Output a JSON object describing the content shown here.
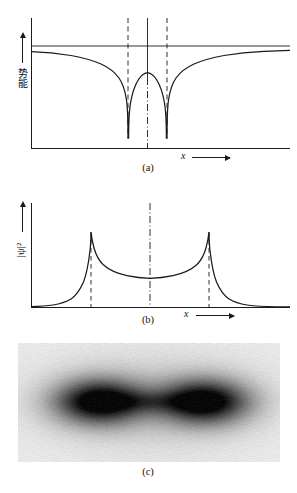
{
  "figure": {
    "background_color": "#ffffff",
    "line_color": "#1a1a1a",
    "width": 297,
    "height": 493
  },
  "panels": [
    {
      "id": "a",
      "caption": "(a)",
      "ylabel": "势能",
      "ylabel_meaning": "potential-energy",
      "xlabel": "x",
      "description": "Double-well potential energy curve with two deep wells and a central hump"
    },
    {
      "id": "b",
      "caption": "(b)",
      "ylabel": "|ψ|²",
      "ylabel_meaning": "probability-density",
      "xlabel": "x",
      "description": "Probability density showing two sharp cusps at the nuclei positions"
    },
    {
      "id": "c",
      "caption": "(c)",
      "description": "Grayscale electron density map showing two dark lobes joined by a faint bridge"
    }
  ],
  "chart_data": [
    {
      "type": "line",
      "panel": "a",
      "title": "",
      "xlabel": "x",
      "ylabel": "势能",
      "xlim": [
        0,
        1
      ],
      "ylim": [
        -1.15,
        0.22
      ],
      "grid": false,
      "legend": null,
      "annotations": {
        "zero_level_line": 0.0,
        "nucleus_positions": [
          0.385,
          0.57
        ],
        "center_axis": 0.478,
        "dashed_vertical_lines": [
          0.385,
          0.57
        ],
        "dashdot_center_line": 0.478
      },
      "series": [
        {
          "name": "potential",
          "comment": "Coulombic double well V(x) = -k/|x-x1| - k/|x-x2| clipped at well floor",
          "x": [
            0.0,
            0.04,
            0.08,
            0.12,
            0.16,
            0.2,
            0.24,
            0.27,
            0.3,
            0.325,
            0.345,
            0.36,
            0.372,
            0.38,
            0.384,
            0.388,
            0.396,
            0.41,
            0.425,
            0.44,
            0.455,
            0.465,
            0.472,
            0.478,
            0.484,
            0.492,
            0.5,
            0.512,
            0.526,
            0.54,
            0.552,
            0.562,
            0.568,
            0.572,
            0.576,
            0.582,
            0.592,
            0.606,
            0.624,
            0.645,
            0.67,
            0.7,
            0.74,
            0.79,
            0.85,
            0.92,
            1.0
          ],
          "y": [
            -0.055,
            -0.058,
            -0.062,
            -0.068,
            -0.078,
            -0.092,
            -0.118,
            -0.15,
            -0.21,
            -0.3,
            -0.42,
            -0.56,
            -0.76,
            -0.93,
            -1.0,
            -1.0,
            -0.93,
            -0.72,
            -0.54,
            -0.42,
            -0.35,
            -0.322,
            -0.312,
            -0.308,
            -0.312,
            -0.322,
            -0.34,
            -0.388,
            -0.47,
            -0.6,
            -0.76,
            -0.9,
            -0.97,
            -1.0,
            -1.0,
            -0.93,
            -0.76,
            -0.56,
            -0.4,
            -0.29,
            -0.21,
            -0.155,
            -0.112,
            -0.085,
            -0.068,
            -0.058,
            -0.052
          ]
        }
      ]
    },
    {
      "type": "line",
      "panel": "b",
      "title": "",
      "xlabel": "x",
      "ylabel": "|ψ|²",
      "xlim": [
        0,
        1
      ],
      "ylim": [
        0,
        1.1
      ],
      "grid": false,
      "legend": null,
      "annotations": {
        "peak_positions": [
          0.26,
          0.705
        ],
        "dashed_vertical_lines": [
          0.26,
          0.705
        ],
        "dashdot_center_line": 0.478,
        "central_minimum": 0.478
      },
      "series": [
        {
          "name": "probability-density",
          "comment": "|psi|^2 for bonding molecular orbital: cusps at nuclei, shallow minimum at centre",
          "x": [
            0.0,
            0.04,
            0.08,
            0.11,
            0.14,
            0.165,
            0.188,
            0.208,
            0.224,
            0.238,
            0.248,
            0.255,
            0.26,
            0.266,
            0.278,
            0.294,
            0.316,
            0.342,
            0.372,
            0.404,
            0.438,
            0.47,
            0.478,
            0.506,
            0.54,
            0.574,
            0.608,
            0.64,
            0.668,
            0.69,
            0.7,
            0.705,
            0.712,
            0.72,
            0.732,
            0.748,
            0.766,
            0.788,
            0.812,
            0.84,
            0.872,
            0.91,
            0.95,
            1.0
          ],
          "y": [
            0.005,
            0.008,
            0.016,
            0.026,
            0.044,
            0.07,
            0.11,
            0.17,
            0.252,
            0.37,
            0.505,
            0.65,
            0.87,
            0.812,
            0.742,
            0.69,
            0.646,
            0.608,
            0.576,
            0.552,
            0.536,
            0.528,
            0.527,
            0.532,
            0.546,
            0.568,
            0.598,
            0.636,
            0.684,
            0.742,
            0.8,
            0.87,
            0.66,
            0.51,
            0.37,
            0.255,
            0.172,
            0.112,
            0.072,
            0.045,
            0.027,
            0.015,
            0.008,
            0.004
          ]
        }
      ]
    },
    {
      "type": "heatmap",
      "panel": "c",
      "title": "",
      "colormap": "grayscale-inverted",
      "description": "Electron probability density rendered as a dark-on-light halftone image",
      "lobes": [
        {
          "cx": 0.31,
          "cy": 0.49,
          "intensity": 1.0,
          "radius": 0.18
        },
        {
          "cx": 0.71,
          "cy": 0.49,
          "intensity": 1.0,
          "radius": 0.18
        }
      ],
      "bridge": {
        "between": [
          0.31,
          0.71
        ],
        "intensity": 0.22
      },
      "background_level": 0.1
    }
  ]
}
